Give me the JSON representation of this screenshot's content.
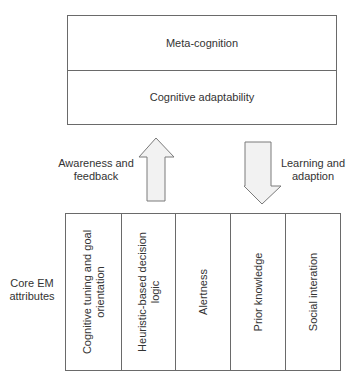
{
  "top_box": {
    "rows": [
      {
        "label": "Meta-cognition"
      },
      {
        "label": "Cognitive adaptability"
      }
    ]
  },
  "arrows": {
    "up": {
      "label_line1": "Awareness and",
      "label_line2": "feedback",
      "direction": "up"
    },
    "down": {
      "label_line1": "Learning and",
      "label_line2": "adaption",
      "direction": "down"
    },
    "fill": "#f2f2f2",
    "stroke": "#7a7a7a"
  },
  "bottom_box": {
    "side_label_line1": "Core EM",
    "side_label_line2": "attributes",
    "columns": [
      {
        "label_line1": "Cognitive tuning and goal",
        "label_line2": "orientation"
      },
      {
        "label_line1": "Heuristic-based decision",
        "label_line2": "logic"
      },
      {
        "label_line1": "Alertness",
        "label_line2": ""
      },
      {
        "label_line1": "Prior knowledge",
        "label_line2": ""
      },
      {
        "label_line1": "Social interation",
        "label_line2": ""
      }
    ]
  }
}
